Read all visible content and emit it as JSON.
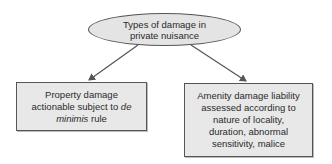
{
  "diagram": {
    "root": {
      "lines": [
        "Types of damage in",
        "private nuisance"
      ]
    },
    "children": [
      {
        "id": "property",
        "lines": [
          "Property damage",
          "actionable subject to ",
          "de",
          "minimis",
          " rule"
        ],
        "line1": "Property damage",
        "line2_plain": "actionable subject to ",
        "line2_italic": "de",
        "line3_italic": "minimis",
        "line3_plain": " rule"
      },
      {
        "id": "amenity",
        "lines": [
          "Amenity damage liability",
          "assessed according to",
          "nature of locality,",
          "duration, abnormal",
          "sensitivity, malice"
        ]
      }
    ],
    "colors": {
      "fill": "#e4e4e4",
      "stroke": "#555555",
      "arrow": "#555555"
    }
  }
}
